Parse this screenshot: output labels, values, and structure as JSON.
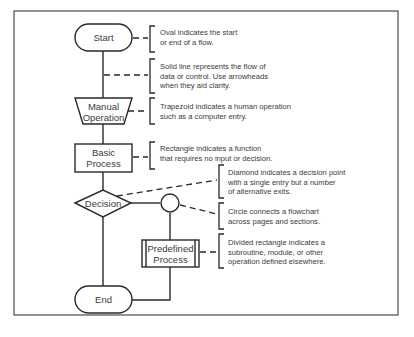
{
  "diagram": {
    "type": "flowchart-legend",
    "border_color": "#4a4a4a",
    "shapes": {
      "start": {
        "label": "Start",
        "shape": "oval"
      },
      "manual_operation": {
        "label_line1": "Manual",
        "label_line2": "Operation",
        "shape": "trapezoid"
      },
      "basic_process": {
        "label_line1": "Basic",
        "label_line2": "Process",
        "shape": "rectangle"
      },
      "decision": {
        "label": "Decision",
        "shape": "diamond"
      },
      "connector": {
        "label": "",
        "shape": "circle"
      },
      "predefined_process": {
        "label_line1": "Predefined",
        "label_line2": "Process",
        "shape": "divided-rectangle"
      },
      "end": {
        "label": "End",
        "shape": "oval"
      }
    },
    "descriptions": [
      {
        "target": "oval",
        "lines": [
          "Oval indicates the start",
          "or end of a flow."
        ]
      },
      {
        "target": "solid-line",
        "lines": [
          "Solid line represents the flow of",
          "data or control. Use arrowheads",
          "when they aid clarity."
        ]
      },
      {
        "target": "trapezoid",
        "lines": [
          "Trapezoid indicates a human operation",
          "such as a computer entry."
        ]
      },
      {
        "target": "rectangle",
        "lines": [
          "Rectangle indicates a function",
          "that requires no input or decision."
        ]
      },
      {
        "target": "diamond",
        "lines": [
          "Diamond indicates a decision point",
          "with a single entry but a number",
          "of alternative exits."
        ]
      },
      {
        "target": "circle",
        "lines": [
          "Circle connects a flowchart",
          "across pages and sections."
        ]
      },
      {
        "target": "divided-rectangle",
        "lines": [
          "Divided rectangle indicates a",
          "subroutine, module, or other",
          "operation defined elsewhere."
        ]
      }
    ]
  }
}
